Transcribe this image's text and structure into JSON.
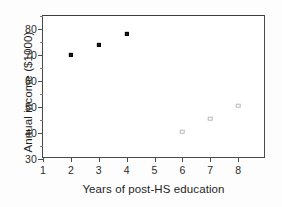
{
  "chart_data": {
    "type": "scatter",
    "title": "",
    "xlabel": "Years of post-HS education",
    "ylabel": "Annual income ($1000)",
    "xlim": [
      1,
      9
    ],
    "ylim": [
      30,
      85
    ],
    "xticks": [
      1,
      2,
      3,
      4,
      5,
      6,
      7,
      8
    ],
    "xtick_labels": [
      "1",
      "2",
      "3",
      "4",
      "5",
      "6",
      "7",
      "8"
    ],
    "yticks": [
      30,
      40,
      50,
      60,
      70,
      80
    ],
    "ytick_labels": [
      "30",
      "40",
      "50",
      "60",
      "70",
      "80"
    ],
    "y_minor_ticks": [
      35,
      45,
      55,
      65,
      75,
      85
    ],
    "grid": false,
    "legend": null,
    "series": [
      {
        "name": "observed",
        "marker": "filled-square",
        "color": "#1b1b1b",
        "x": [
          2,
          3,
          4
        ],
        "y": [
          70,
          74,
          78
        ]
      },
      {
        "name": "predicted",
        "marker": "open-square",
        "color": "#b9b9b9",
        "x": [
          6,
          7,
          8
        ],
        "y": [
          40.5,
          45.5,
          50.5
        ]
      }
    ]
  }
}
